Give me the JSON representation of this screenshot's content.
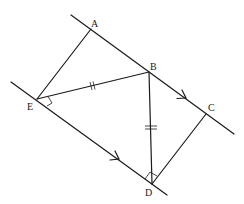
{
  "diagram": {
    "type": "geometry",
    "points": {
      "A": {
        "label": "A",
        "x": 91,
        "y": 29
      },
      "B": {
        "label": "B",
        "x": 149,
        "y": 72
      },
      "C": {
        "label": "C",
        "x": 206,
        "y": 114
      },
      "D": {
        "label": "D",
        "x": 152,
        "y": 184
      },
      "E": {
        "label": "E",
        "x": 37,
        "y": 99
      }
    },
    "segments": [
      "AE",
      "EB",
      "BD",
      "DC"
    ],
    "parallel_lines": [
      {
        "through": [
          "A",
          "B",
          "C"
        ],
        "arrow": true
      },
      {
        "through": [
          "E",
          "D"
        ],
        "arrow": true
      }
    ],
    "equal_marks": [
      {
        "segment": "EB",
        "ticks": 2
      },
      {
        "segment": "BD",
        "ticks": 2
      }
    ],
    "angle_marks": [
      "E",
      "D"
    ],
    "colors": {
      "stroke": "#1a1a1a",
      "background": "#ffffff"
    }
  }
}
